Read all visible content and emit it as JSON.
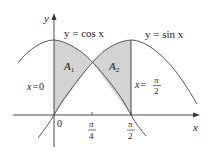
{
  "figure": {
    "type": "area-between-curves",
    "colors": {
      "curve": "#555555",
      "axis": "#333333",
      "shade": "#d3d3d3",
      "text": "#1a1a1a"
    },
    "axes": {
      "x_label": "x",
      "y_label": "y",
      "origin_label": "0",
      "ticks": [
        {
          "num": "π",
          "den": "4"
        },
        {
          "num": "π",
          "den": "2"
        }
      ]
    },
    "curves": [
      {
        "name": "cos",
        "label": "y = cos x"
      },
      {
        "name": "sin",
        "label": "y = sin x"
      }
    ],
    "regions": [
      {
        "name": "A1",
        "base": "A",
        "sub": "1"
      },
      {
        "name": "A2",
        "base": "A",
        "sub": "2"
      }
    ],
    "boundaries": {
      "left": {
        "lhs": "x",
        "eq": "=",
        "rhs": "0"
      },
      "right": {
        "lhs": "x",
        "eq": "=",
        "num": "π",
        "den": "2"
      }
    }
  }
}
